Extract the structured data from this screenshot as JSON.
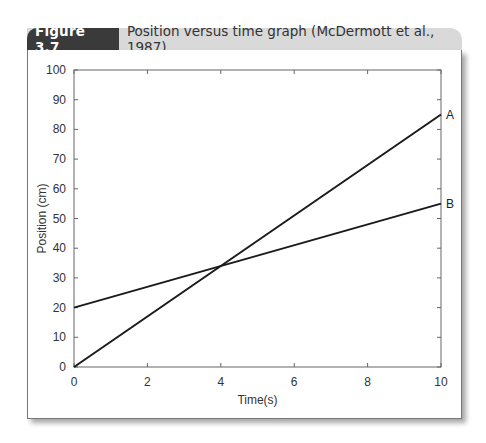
{
  "figure": {
    "label": "Figure 3.7",
    "title": "Position versus time graph (McDermott et al., 1987)"
  },
  "chart_data": {
    "type": "line",
    "title": "Position versus time graph (McDermott et al., 1987)",
    "xlabel": "Time(s)",
    "ylabel": "Position (cm)",
    "xlim": [
      0,
      10
    ],
    "ylim": [
      0,
      100
    ],
    "xticks": [
      0,
      2,
      4,
      6,
      8,
      10
    ],
    "yticks": [
      0,
      10,
      20,
      30,
      40,
      50,
      60,
      70,
      80,
      90,
      100
    ],
    "grid": false,
    "legend": "inline labels at right end of lines",
    "series": [
      {
        "name": "A",
        "x": [
          0,
          10
        ],
        "y": [
          0,
          85
        ]
      },
      {
        "name": "B",
        "x": [
          0,
          10
        ],
        "y": [
          20,
          55
        ]
      }
    ],
    "annotations": [
      "A",
      "B"
    ]
  },
  "colors": {
    "label_bg": "#3a3a3a",
    "header_bg": "#d9d9d9",
    "line": "#1a1a1a"
  }
}
